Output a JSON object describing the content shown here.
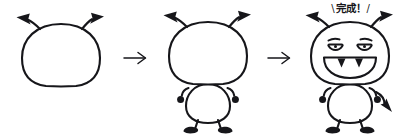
{
  "illustration": {
    "title": "Monster drawing tutorial",
    "subject": "cute monster character",
    "medium": "black ink line drawing on white background",
    "background_color": "#ffffff",
    "ink_color": "#16161a",
    "step_count": 3
  },
  "caption": {
    "text": "完成！",
    "romaji": "kansei",
    "meaning": "Complete!",
    "slash_left": "\\",
    "slash_right": "/",
    "position": "above final step"
  },
  "separators": [
    {
      "name": "arrow-1",
      "glyph": "→",
      "between": "step 1 and step 2"
    },
    {
      "name": "arrow-2",
      "glyph": "→",
      "between": "step 2 and step 3"
    }
  ],
  "steps": [
    {
      "index": 1,
      "label": "Step 1",
      "description": "Rounded head outline with two arrow-tipped antennae",
      "parts": [
        "head",
        "left-antenna",
        "right-antenna"
      ]
    },
    {
      "index": 2,
      "label": "Step 2",
      "description": "Add rounded body, two arms with round hands, and two feet",
      "parts": [
        "head",
        "left-antenna",
        "right-antenna",
        "body",
        "left-arm",
        "right-arm",
        "left-foot",
        "right-foot"
      ]
    },
    {
      "index": 3,
      "label": "Step 3",
      "description": "Add angled eyebrows, eyes, fanged grin, and arrow-tipped tail",
      "parts": [
        "head",
        "left-antenna",
        "right-antenna",
        "body",
        "left-arm",
        "right-arm",
        "left-foot",
        "right-foot",
        "left-eyebrow",
        "right-eyebrow",
        "left-eye",
        "right-eye",
        "mouth",
        "fangs",
        "tail"
      ]
    }
  ]
}
